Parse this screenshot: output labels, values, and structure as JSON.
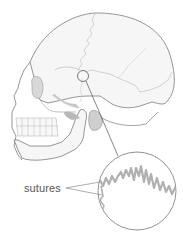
{
  "diagram": {
    "labels": {
      "sutures": "sutures"
    },
    "elements": [
      {
        "name": "skull-outline",
        "description": "side view of cranium with facial bones and mandible"
      },
      {
        "name": "highlight-circle",
        "description": "small circle marking suture location on skull"
      },
      {
        "name": "leader-line",
        "description": "line from highlight circle to magnified inset"
      },
      {
        "name": "magnified-inset",
        "description": "circular inset showing zig-zag suture line"
      },
      {
        "name": "sutures-pointers",
        "description": "two lines from label to suture in inset"
      }
    ],
    "colors": {
      "outline": "#8a8a8a",
      "bone_fill": "#f4f4f4",
      "shadow": "#c8c8c8",
      "suture": "#b0b0b0",
      "label_text": "#555555"
    }
  }
}
